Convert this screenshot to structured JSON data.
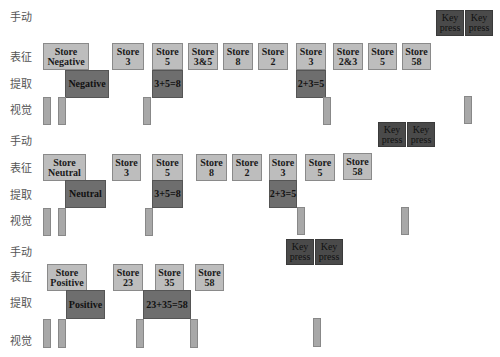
{
  "row_labels": {
    "manual": "手动",
    "representation": "表征",
    "retrieval": "提取",
    "visual": "视觉"
  },
  "panels": [
    {
      "name": "negative",
      "key_presses": [
        {
          "label": "Key press",
          "x": 436,
          "y": 10,
          "w": 28,
          "h": 26
        },
        {
          "label": "Key press",
          "x": 465,
          "y": 10,
          "w": 28,
          "h": 26
        }
      ],
      "stores": [
        {
          "label": "Store\nNegative",
          "x": 43,
          "y": 43,
          "w": 46,
          "h": 27
        },
        {
          "label": "Store\n3",
          "x": 112,
          "y": 43,
          "w": 32,
          "h": 27
        },
        {
          "label": "Store\n5",
          "x": 152,
          "y": 43,
          "w": 31,
          "h": 27
        },
        {
          "label": "Store\n3&5",
          "x": 188,
          "y": 43,
          "w": 30,
          "h": 27
        },
        {
          "label": "Store\n8",
          "x": 223,
          "y": 43,
          "w": 30,
          "h": 27
        },
        {
          "label": "Store\n2",
          "x": 258,
          "y": 43,
          "w": 30,
          "h": 27
        },
        {
          "label": "Store\n3",
          "x": 296,
          "y": 43,
          "w": 30,
          "h": 27
        },
        {
          "label": "Store\n2&3",
          "x": 333,
          "y": 43,
          "w": 30,
          "h": 27
        },
        {
          "label": "Store\n5",
          "x": 368,
          "y": 43,
          "w": 29,
          "h": 27
        },
        {
          "label": "Store\n58",
          "x": 402,
          "y": 43,
          "w": 29,
          "h": 27
        }
      ],
      "retrievals": [
        {
          "label": "Negative",
          "x": 65,
          "y": 70,
          "w": 44,
          "h": 28
        },
        {
          "label": "3+5=8",
          "x": 152,
          "y": 70,
          "w": 31,
          "h": 28
        },
        {
          "label": "2+3=5",
          "x": 296,
          "y": 70,
          "w": 30,
          "h": 28
        }
      ],
      "visuals": [
        {
          "x": 43,
          "y": 97,
          "w": 8,
          "h": 28
        },
        {
          "x": 58,
          "y": 97,
          "w": 8,
          "h": 28
        },
        {
          "x": 143,
          "y": 97,
          "w": 8,
          "h": 28
        },
        {
          "x": 323,
          "y": 97,
          "w": 8,
          "h": 28
        },
        {
          "x": 464,
          "y": 96,
          "w": 8,
          "h": 28
        }
      ],
      "label_y": {
        "manual": 8,
        "representation": 48,
        "retrieval": 75,
        "visual": 101
      }
    },
    {
      "name": "neutral",
      "key_presses": [
        {
          "label": "Key press",
          "x": 378,
          "y": 122,
          "w": 28,
          "h": 25
        },
        {
          "label": "Key press",
          "x": 407,
          "y": 122,
          "w": 28,
          "h": 25
        }
      ],
      "stores": [
        {
          "label": "Store\nNeutral",
          "x": 43,
          "y": 154,
          "w": 43,
          "h": 27
        },
        {
          "label": "Store\n3",
          "x": 112,
          "y": 154,
          "w": 29,
          "h": 27
        },
        {
          "label": "Store\n5",
          "x": 152,
          "y": 154,
          "w": 31,
          "h": 27
        },
        {
          "label": "Store\n8",
          "x": 196,
          "y": 154,
          "w": 31,
          "h": 27
        },
        {
          "label": "Store\n2",
          "x": 232,
          "y": 154,
          "w": 30,
          "h": 27
        },
        {
          "label": "Store\n3",
          "x": 269,
          "y": 154,
          "w": 28,
          "h": 27
        },
        {
          "label": "Store\n5",
          "x": 305,
          "y": 154,
          "w": 30,
          "h": 27
        },
        {
          "label": "Store\n58",
          "x": 343,
          "y": 153,
          "w": 29,
          "h": 27
        }
      ],
      "retrievals": [
        {
          "label": "Neutral",
          "x": 65,
          "y": 180,
          "w": 41,
          "h": 28
        },
        {
          "label": "3+5=8",
          "x": 152,
          "y": 180,
          "w": 31,
          "h": 28
        },
        {
          "label": "2+3=5",
          "x": 269,
          "y": 180,
          "w": 28,
          "h": 28
        }
      ],
      "visuals": [
        {
          "x": 43,
          "y": 208,
          "w": 8,
          "h": 28
        },
        {
          "x": 58,
          "y": 208,
          "w": 8,
          "h": 28
        },
        {
          "x": 145,
          "y": 208,
          "w": 8,
          "h": 28
        },
        {
          "x": 297,
          "y": 207,
          "w": 8,
          "h": 28
        },
        {
          "x": 401,
          "y": 207,
          "w": 8,
          "h": 28
        }
      ],
      "label_y": {
        "manual": 132,
        "representation": 159,
        "retrieval": 186,
        "visual": 212
      }
    },
    {
      "name": "positive",
      "key_presses": [
        {
          "label": "Key press",
          "x": 286,
          "y": 239,
          "w": 28,
          "h": 26
        },
        {
          "label": "Key press",
          "x": 315,
          "y": 239,
          "w": 28,
          "h": 26
        }
      ],
      "stores": [
        {
          "label": "Store\nPositive",
          "x": 47,
          "y": 264,
          "w": 40,
          "h": 27
        },
        {
          "label": "Store\n23",
          "x": 113,
          "y": 264,
          "w": 30,
          "h": 27
        },
        {
          "label": "Store\n35",
          "x": 155,
          "y": 264,
          "w": 29,
          "h": 27
        },
        {
          "label": "Store\n58",
          "x": 195,
          "y": 264,
          "w": 29,
          "h": 27
        }
      ],
      "retrievals": [
        {
          "label": "Positive",
          "x": 66,
          "y": 290,
          "w": 39,
          "h": 29
        },
        {
          "label": "23+35=58",
          "x": 143,
          "y": 290,
          "w": 48,
          "h": 29
        }
      ],
      "visuals": [
        {
          "x": 43,
          "y": 319,
          "w": 8,
          "h": 29
        },
        {
          "x": 58,
          "y": 319,
          "w": 8,
          "h": 29
        },
        {
          "x": 136,
          "y": 319,
          "w": 8,
          "h": 29
        },
        {
          "x": 190,
          "y": 319,
          "w": 8,
          "h": 29
        },
        {
          "x": 313,
          "y": 318,
          "w": 8,
          "h": 29
        }
      ],
      "label_y": {
        "manual": 243,
        "representation": 268,
        "retrieval": 294,
        "visual": 332
      }
    }
  ],
  "colors": {
    "store": "#bdbdbd",
    "retrieval": "#6e6e6e",
    "key_press": "#4a4a4a",
    "visual": "#a8a8a8",
    "label": "#555555"
  }
}
